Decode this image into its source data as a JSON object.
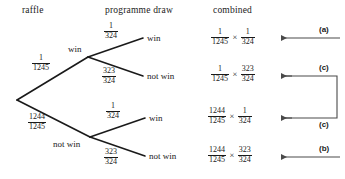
{
  "headers": {
    "raffle": "raffle",
    "programme_draw": "programme draw",
    "combined": "combined"
  },
  "tree": {
    "level1": [
      {
        "prob_num": "1",
        "prob_den": "1245",
        "label": "win"
      },
      {
        "prob_num": "1244",
        "prob_den": "1245",
        "label": "not win"
      }
    ],
    "level2": [
      {
        "prob_num": "1",
        "prob_den": "324",
        "label": "win"
      },
      {
        "prob_num": "323",
        "prob_den": "324",
        "label": "not win"
      },
      {
        "prob_num": "1",
        "prob_den": "324",
        "label": "win"
      },
      {
        "prob_num": "323",
        "prob_den": "324",
        "label": "not win"
      }
    ]
  },
  "combined_rows": [
    {
      "first_num": "1",
      "first_den": "1245",
      "operator": "×",
      "second_num": "1",
      "second_den": "324",
      "annotation": "(a)"
    },
    {
      "first_num": "1",
      "first_den": "1245",
      "operator": "×",
      "second_num": "323",
      "second_den": "324",
      "annotation": "(c)"
    },
    {
      "first_num": "1244",
      "first_den": "1245",
      "operator": "×",
      "second_num": "1",
      "second_den": "324",
      "annotation": "(c)"
    },
    {
      "first_num": "1244",
      "first_den": "1245",
      "operator": "×",
      "second_num": "323",
      "second_den": "324",
      "annotation": "(b)"
    }
  ],
  "colors": {
    "ink": "#1a1a1a",
    "background": "#ffffff"
  }
}
